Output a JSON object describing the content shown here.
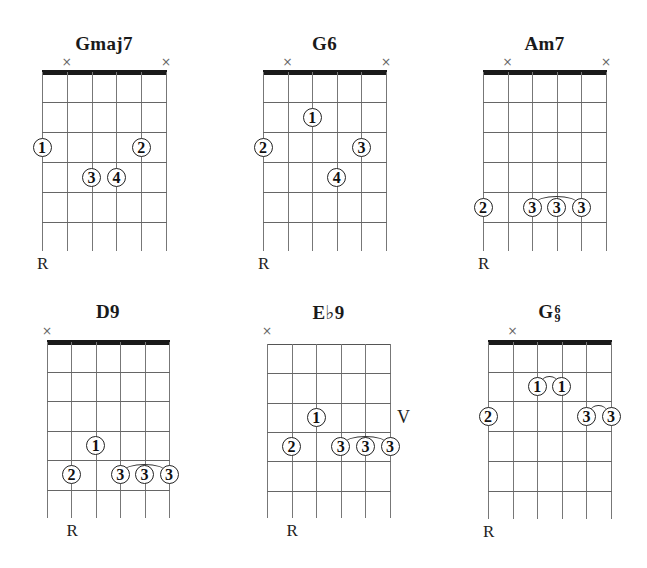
{
  "chart_data": {
    "type": "diagram",
    "chords": [
      {
        "name": "Gmaj7",
        "name_base": "Gmaj7",
        "name_sup": null,
        "name_sub": null,
        "x": 42,
        "width": 124,
        "title_y": 33,
        "nut_y": 72,
        "nut": true,
        "fret_spacing": 30,
        "fret_count": 6,
        "muted_strings": [
          2,
          6
        ],
        "mute_y": 56,
        "fingers": [
          {
            "string": 1,
            "fret": 3,
            "finger": "1"
          },
          {
            "string": 5,
            "fret": 3,
            "finger": "2"
          },
          {
            "string": 3,
            "fret": 4,
            "finger": "3"
          },
          {
            "string": 4,
            "fret": 4,
            "finger": "4"
          }
        ],
        "barres": [],
        "root_string": 1,
        "root_label": "R",
        "position_label": null
      },
      {
        "name": "G6",
        "name_base": "G6",
        "name_sup": null,
        "name_sub": null,
        "x": 263,
        "width": 123,
        "title_y": 33,
        "nut_y": 72,
        "nut": true,
        "fret_spacing": 30,
        "fret_count": 6,
        "muted_strings": [
          2,
          6
        ],
        "mute_y": 56,
        "fingers": [
          {
            "string": 3,
            "fret": 2,
            "finger": "1"
          },
          {
            "string": 1,
            "fret": 3,
            "finger": "2"
          },
          {
            "string": 5,
            "fret": 3,
            "finger": "3"
          },
          {
            "string": 4,
            "fret": 4,
            "finger": "4"
          }
        ],
        "barres": [],
        "root_string": 1,
        "root_label": "R",
        "position_label": null
      },
      {
        "name": "Am7",
        "name_base": "Am7",
        "name_sup": null,
        "name_sub": null,
        "x": 483,
        "width": 123,
        "title_y": 33,
        "nut_y": 72,
        "nut": true,
        "fret_spacing": 30,
        "fret_count": 6,
        "muted_strings": [
          2,
          6
        ],
        "mute_y": 56,
        "fingers": [
          {
            "string": 1,
            "fret": 5,
            "finger": "2"
          },
          {
            "string": 3,
            "fret": 5,
            "finger": "3"
          },
          {
            "string": 4,
            "fret": 5,
            "finger": "3"
          },
          {
            "string": 5,
            "fret": 5,
            "finger": "3"
          }
        ],
        "barres": [
          {
            "from_string": 3,
            "to_string": 5,
            "fret": 5
          }
        ],
        "root_string": 1,
        "root_label": "R",
        "position_label": null
      },
      {
        "name": "D9",
        "name_base": "D9",
        "name_sup": null,
        "name_sub": null,
        "x": 47,
        "width": 122,
        "title_y": 301,
        "nut_y": 342,
        "nut": true,
        "fret_spacing": 29.5,
        "fret_count": 6,
        "muted_strings": [
          1
        ],
        "mute_y": 325,
        "fingers": [
          {
            "string": 3,
            "fret": 4,
            "finger": "1"
          },
          {
            "string": 2,
            "fret": 5,
            "finger": "2"
          },
          {
            "string": 4,
            "fret": 5,
            "finger": "3"
          },
          {
            "string": 5,
            "fret": 5,
            "finger": "3"
          },
          {
            "string": 6,
            "fret": 5,
            "finger": "3"
          }
        ],
        "barres": [
          {
            "from_string": 4,
            "to_string": 6,
            "fret": 5
          }
        ],
        "root_string": 2,
        "root_label": "R",
        "position_label": null
      },
      {
        "name": "E♭9",
        "name_base": "E♭9",
        "name_sup": null,
        "name_sub": null,
        "x": 267,
        "width": 123,
        "title_y": 301,
        "nut_y": 344,
        "nut": false,
        "fret_spacing": 29.3,
        "fret_count": 6,
        "muted_strings": [
          1
        ],
        "mute_y": 325,
        "fingers": [
          {
            "string": 3,
            "fret": 3,
            "finger": "1"
          },
          {
            "string": 2,
            "fret": 4,
            "finger": "2"
          },
          {
            "string": 4,
            "fret": 4,
            "finger": "3"
          },
          {
            "string": 5,
            "fret": 4,
            "finger": "3"
          },
          {
            "string": 6,
            "fret": 4,
            "finger": "3"
          }
        ],
        "barres": [
          {
            "from_string": 4,
            "to_string": 6,
            "fret": 4
          }
        ],
        "root_string": 2,
        "root_label": "R",
        "position_label": {
          "text": "V",
          "fret": 3
        }
      },
      {
        "name": "G6/9",
        "name_base": "G",
        "name_sup": "6",
        "name_sub": "9",
        "x": 488,
        "width": 123,
        "title_y": 301,
        "nut_y": 342,
        "nut": true,
        "fret_spacing": 29.7,
        "fret_count": 6,
        "muted_strings": [
          2
        ],
        "mute_y": 325,
        "fingers": [
          {
            "string": 3,
            "fret": 2,
            "finger": "1"
          },
          {
            "string": 4,
            "fret": 2,
            "finger": "1"
          },
          {
            "string": 1,
            "fret": 3,
            "finger": "2"
          },
          {
            "string": 5,
            "fret": 3,
            "finger": "3"
          },
          {
            "string": 6,
            "fret": 3,
            "finger": "3"
          }
        ],
        "barres": [
          {
            "from_string": 3,
            "to_string": 4,
            "fret": 2
          },
          {
            "from_string": 5,
            "to_string": 6,
            "fret": 3
          }
        ],
        "root_string": 1,
        "root_label": "R",
        "position_label": null
      }
    ]
  },
  "labels": {
    "mute_symbol": "×"
  }
}
